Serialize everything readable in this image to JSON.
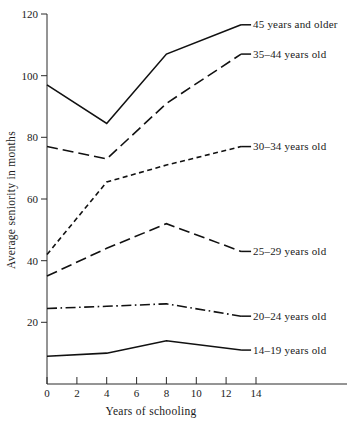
{
  "chart_data": {
    "type": "line",
    "title": "",
    "xlabel": "Years of schooling",
    "ylabel": "Average seniority in months",
    "xlim": [
      0,
      16
    ],
    "ylim": [
      0,
      120
    ],
    "grid": false,
    "legend_position": "right-inline-labels",
    "x_ticks": [
      "0",
      "2",
      "4",
      "6",
      "8",
      "10",
      "12",
      "14"
    ],
    "x_tick_values": [
      0,
      2,
      4,
      6,
      8,
      10,
      12,
      14
    ],
    "y_ticks": [
      "20",
      "40",
      "60",
      "80",
      "100",
      "120"
    ],
    "y_tick_values": [
      20,
      40,
      60,
      80,
      100,
      120
    ],
    "x": [
      0,
      4,
      8,
      13
    ],
    "series": [
      {
        "name": "45 years and older",
        "label": "45 years and older",
        "style": "solid",
        "values": [
          97,
          84.5,
          107,
          116.5
        ]
      },
      {
        "name": "35-44 years old",
        "label": "35–44 years old",
        "style": "long-dash",
        "values": [
          77,
          73,
          91,
          107
        ]
      },
      {
        "name": "30-34 years old",
        "label": "30–34 years old",
        "style": "short-dash",
        "values": [
          42,
          65.5,
          71,
          77
        ]
      },
      {
        "name": "25-29 years old",
        "label": "25–29 years old",
        "style": "long-dash",
        "values": [
          35,
          44,
          52,
          43
        ]
      },
      {
        "name": "20-24 years old",
        "label": "20–24 years old",
        "style": "dash-dot",
        "values": [
          24.5,
          25.2,
          26,
          22
        ]
      },
      {
        "name": "14-19 years old",
        "label": "14–19 years old",
        "style": "solid",
        "values": [
          9,
          10,
          14,
          11
        ]
      }
    ]
  },
  "axes": {
    "y_title": "Average seniority in months",
    "x_title": "Years of schooling"
  },
  "ticks": {
    "y": {
      "t120": "120",
      "t100": "100",
      "t80": "80",
      "t60": "60",
      "t40": "40",
      "t20": "20"
    },
    "x": {
      "t0": "0",
      "t2": "2",
      "t4": "4",
      "t6": "6",
      "t8": "8",
      "t10": "10",
      "t12": "12",
      "t14": "14"
    }
  },
  "labels": {
    "s45": "45 years and older",
    "s35": "35–44 years old",
    "s30": "30–34 years old",
    "s25": "25–29 years old",
    "s20": "20–24 years old",
    "s14": "14–19 years old"
  },
  "colors": {
    "ink": "#111111",
    "axis": "#2b2b2b",
    "background": "#ffffff"
  }
}
